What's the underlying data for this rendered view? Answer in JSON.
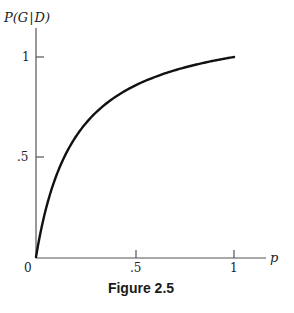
{
  "chart_data": {
    "type": "line",
    "title": "",
    "xlabel": "p",
    "ylabel": "P(G|D)",
    "xlim": [
      0,
      1.12
    ],
    "ylim": [
      0,
      1.05
    ],
    "grid": false,
    "legend": null,
    "x_ticks": [
      {
        "value": 0,
        "label": "0"
      },
      {
        "value": 0.5,
        "label": ".5"
      },
      {
        "value": 1,
        "label": "1"
      }
    ],
    "y_ticks": [
      {
        "value": 0.5,
        "label": ".5"
      },
      {
        "value": 1,
        "label": "1"
      }
    ],
    "series": [
      {
        "name": "P(G|D)",
        "x": [
          0,
          0.02,
          0.05,
          0.1,
          0.15,
          0.2,
          0.3,
          0.4,
          0.5,
          0.6,
          0.7,
          0.8,
          0.9,
          1.0
        ],
        "values": [
          0,
          0.109,
          0.24,
          0.4,
          0.514,
          0.6,
          0.72,
          0.8,
          0.857,
          0.9,
          0.933,
          0.96,
          0.982,
          1.0
        ]
      }
    ],
    "caption": "Figure 2.5"
  },
  "labels": {
    "y_axis_label_prefix": "P(G",
    "y_axis_label_suffix": "D)",
    "x_axis_label": "p",
    "origin": "0",
    "x_tick_half": ".5",
    "x_tick_one": "1",
    "y_tick_half": ".5",
    "y_tick_one": "1",
    "caption": "Figure 2.5"
  },
  "colors": {
    "axis": "#555555",
    "curve": "#111111"
  }
}
